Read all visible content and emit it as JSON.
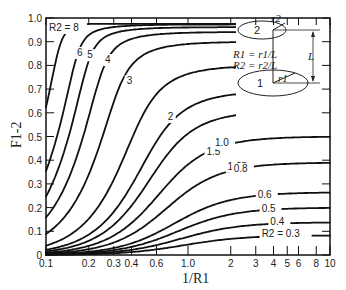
{
  "chart_data": {
    "type": "line",
    "title": "",
    "xlabel": "1/R1",
    "ylabel": "F1-2",
    "xscale": "log",
    "xlim": [
      0.1,
      10
    ],
    "ylim": [
      0,
      1.0
    ],
    "grid": false,
    "legend": "none (curves labeled inline)",
    "xticks": [
      {
        "value": 0.1,
        "label": "0.1"
      },
      {
        "value": 0.2,
        "label": "0.2"
      },
      {
        "value": 0.3,
        "label": "0.3"
      },
      {
        "value": 0.4,
        "label": "0.4"
      },
      {
        "value": 0.6,
        "label": "0.6"
      },
      {
        "value": 1.0,
        "label": "1.0"
      },
      {
        "value": 2,
        "label": "2"
      },
      {
        "value": 3,
        "label": "3"
      },
      {
        "value": 4,
        "label": "4"
      },
      {
        "value": 5,
        "label": "5"
      },
      {
        "value": 6,
        "label": "6"
      },
      {
        "value": 8,
        "label": "8"
      },
      {
        "value": 10,
        "label": "10"
      }
    ],
    "yticks": [
      {
        "value": 0,
        "label": "0"
      },
      {
        "value": 0.1,
        "label": "0.1"
      },
      {
        "value": 0.2,
        "label": "0.2"
      },
      {
        "value": 0.3,
        "label": "0.3"
      },
      {
        "value": 0.4,
        "label": "0.4"
      },
      {
        "value": 0.5,
        "label": "0.5"
      },
      {
        "value": 0.6,
        "label": "0.6"
      },
      {
        "value": 0.7,
        "label": "0.7"
      },
      {
        "value": 0.8,
        "label": "0.8"
      },
      {
        "value": 0.9,
        "label": "0.9"
      },
      {
        "value": 1.0,
        "label": "1.0"
      }
    ],
    "x": [
      0.1,
      0.2,
      0.3,
      0.4,
      0.6,
      1.0,
      2,
      3,
      4,
      6,
      8,
      10
    ],
    "series": [
      {
        "name": "R2 = 8",
        "label": "R2 = 8",
        "R2": 8,
        "values": [
          0.62,
          0.94,
          0.97,
          0.98,
          0.98,
          0.98,
          0.98,
          0.98,
          0.98,
          0.98,
          0.98,
          0.98
        ]
      },
      {
        "name": "R2 = 6",
        "label": "6",
        "R2": 6,
        "values": [
          0.27,
          0.77,
          0.92,
          0.95,
          0.97,
          0.97,
          0.97,
          0.97,
          0.97,
          0.97,
          0.97,
          0.97
        ]
      },
      {
        "name": "R2 = 5",
        "label": "5",
        "R2": 5,
        "values": [
          0.2,
          0.63,
          0.87,
          0.93,
          0.95,
          0.96,
          0.96,
          0.96,
          0.96,
          0.96,
          0.96,
          0.96
        ]
      },
      {
        "name": "R2 = 4",
        "label": "4",
        "R2": 4,
        "values": [
          0.14,
          0.45,
          0.76,
          0.87,
          0.92,
          0.94,
          0.94,
          0.94,
          0.94,
          0.94,
          0.94,
          0.94
        ]
      },
      {
        "name": "R2 = 3",
        "label": "3",
        "R2": 3,
        "values": [
          0.08,
          0.27,
          0.53,
          0.71,
          0.84,
          0.88,
          0.9,
          0.9,
          0.9,
          0.9,
          0.9,
          0.9
        ]
      },
      {
        "name": "R2 = 2",
        "label": "2",
        "R2": 2,
        "values": [
          0.04,
          0.13,
          0.27,
          0.4,
          0.6,
          0.72,
          0.78,
          0.79,
          0.8,
          0.8,
          0.8,
          0.8
        ]
      },
      {
        "name": "R2 = 1.5",
        "label": "1.5",
        "R2": 1.5,
        "values": [
          0.02,
          0.08,
          0.16,
          0.25,
          0.41,
          0.56,
          0.65,
          0.67,
          0.68,
          0.69,
          0.69,
          0.69
        ]
      },
      {
        "name": "R2 = 1.25",
        "label": "1.25",
        "R2": 1.25,
        "values": [
          0.015,
          0.06,
          0.12,
          0.19,
          0.32,
          0.47,
          0.56,
          0.59,
          0.6,
          0.61,
          0.61,
          0.61
        ]
      },
      {
        "name": "R2 = 1.0",
        "label": "1.0",
        "R2": 1.0,
        "values": [
          0.01,
          0.04,
          0.08,
          0.13,
          0.24,
          0.38,
          0.46,
          0.48,
          0.49,
          0.5,
          0.5,
          0.5
        ]
      },
      {
        "name": "R2 = 0.8",
        "label": "0.8",
        "R2": 0.8,
        "values": [
          0.006,
          0.02,
          0.05,
          0.09,
          0.17,
          0.28,
          0.35,
          0.37,
          0.38,
          0.39,
          0.39,
          0.39
        ]
      },
      {
        "name": "R2 = 0.6",
        "label": "0.6",
        "R2": 0.6,
        "values": [
          0.003,
          0.01,
          0.03,
          0.05,
          0.1,
          0.18,
          0.23,
          0.25,
          0.25,
          0.26,
          0.26,
          0.26
        ]
      },
      {
        "name": "R2 = 0.5",
        "label": "0.5",
        "R2": 0.5,
        "values": [
          0.002,
          0.009,
          0.02,
          0.035,
          0.07,
          0.13,
          0.18,
          0.19,
          0.19,
          0.2,
          0.2,
          0.2
        ]
      },
      {
        "name": "R2 = 0.4",
        "label": "0.4",
        "R2": 0.4,
        "values": [
          0.0015,
          0.006,
          0.013,
          0.023,
          0.046,
          0.09,
          0.12,
          0.13,
          0.14,
          0.14,
          0.14,
          0.14
        ]
      },
      {
        "name": "R2 = 0.3",
        "label": "R2 = 0.3",
        "R2": 0.3,
        "values": [
          0.0008,
          0.003,
          0.007,
          0.013,
          0.027,
          0.05,
          0.07,
          0.075,
          0.08,
          0.08,
          0.08,
          0.08
        ]
      }
    ],
    "inset": {
      "disk_top_label": "2",
      "disk_bottom_label": "1",
      "radius_top_label": "r2",
      "radius_bottom_label": "r1",
      "spacing_label": "L",
      "formula_1": "R1 = r1/L",
      "formula_2": "R2 = r2/L"
    }
  }
}
